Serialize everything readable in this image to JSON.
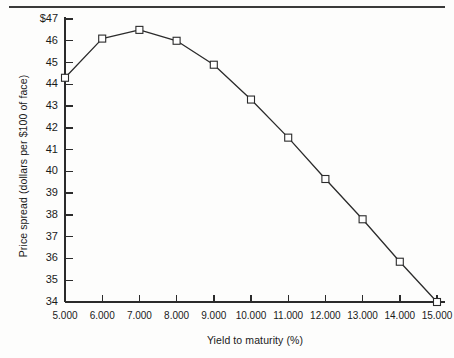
{
  "chart_data": {
    "type": "line",
    "title": "",
    "subtitle": "",
    "xlabel": "Yield to maturity (%)",
    "ylabel": "Price spread (dollars per $100 of face)",
    "x": [
      5.0,
      6.0,
      7.0,
      8.0,
      9.0,
      10.0,
      11.0,
      12.0,
      13.0,
      14.0,
      15.0
    ],
    "values": [
      44.3,
      46.1,
      46.5,
      46.0,
      44.9,
      43.3,
      41.55,
      39.65,
      37.8,
      35.85,
      34.0
    ],
    "series": [
      {
        "name": "Price spread",
        "values": [
          44.3,
          46.1,
          46.5,
          46.0,
          44.9,
          43.3,
          41.55,
          39.65,
          37.8,
          35.85,
          34.0
        ]
      }
    ],
    "xtick_labels": [
      "5.000",
      "6.000",
      "7.000",
      "8.000",
      "9.000",
      "10.000",
      "11.000",
      "12.000",
      "13.000",
      "14.000",
      "15.000"
    ],
    "xticks": [
      5,
      6,
      7,
      8,
      9,
      10,
      11,
      12,
      13,
      14,
      15
    ],
    "ytick_labels": [
      "$47",
      "46",
      "45",
      "44",
      "43",
      "42",
      "41",
      "40",
      "39",
      "38",
      "37",
      "36",
      "35",
      "34"
    ],
    "yticks": [
      47,
      46,
      45,
      44,
      43,
      42,
      41,
      40,
      39,
      38,
      37,
      36,
      35,
      34
    ],
    "xlim": [
      5,
      15
    ],
    "ylim": [
      34,
      47
    ],
    "grid": false,
    "legend": "none",
    "marker": "open-square",
    "line_color": "#2b2b2b",
    "marker_edge_color": "#2b2b2b",
    "marker_face_color": "#ffffff",
    "axis_color": "#2b2b2b",
    "background_color": "#fdfdfc"
  },
  "figure": {
    "top_rule": "horizontal-rule"
  }
}
